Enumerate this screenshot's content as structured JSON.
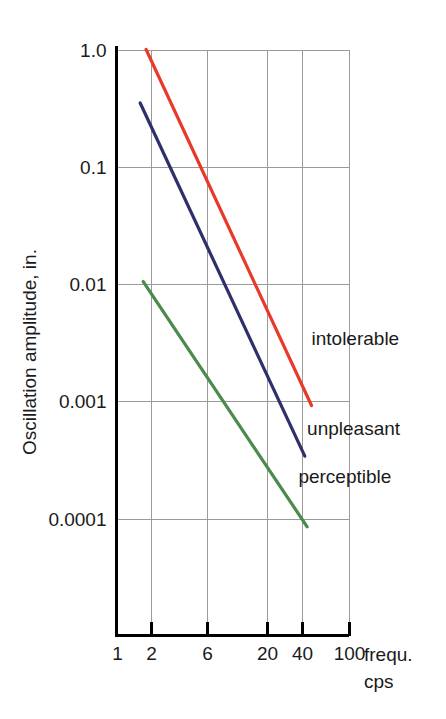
{
  "chart_data": {
    "type": "line",
    "title": "",
    "xlabel": "frequ. cps",
    "xlabel_line1": "frequ.",
    "xlabel_line2": "cps",
    "ylabel": "Oscillation amplitude, in.",
    "xscale": "log",
    "yscale": "log",
    "xlim": [
      1,
      100
    ],
    "ylim": [
      0.0001,
      1.0
    ],
    "grid": true,
    "legend_position": "inline-right-of-curves",
    "xticks": [
      {
        "value": 1,
        "label": "1"
      },
      {
        "value": 2,
        "label": "2"
      },
      {
        "value": 6,
        "label": "6"
      },
      {
        "value": 20,
        "label": "20"
      },
      {
        "value": 40,
        "label": "40"
      },
      {
        "value": 100,
        "label": "100"
      }
    ],
    "yticks": [
      {
        "value": 1.0,
        "label": "1.0"
      },
      {
        "value": 0.1,
        "label": "0.1"
      },
      {
        "value": 0.01,
        "label": "0.01"
      },
      {
        "value": 0.001,
        "label": "0.001"
      },
      {
        "value": 0.0001,
        "label": "0.0001"
      }
    ],
    "series": [
      {
        "name": "intolerable",
        "color": "#e8392a",
        "label": "intolerable",
        "label_at": {
          "x": 48,
          "y": 0.003
        },
        "x": [
          1.8,
          48
        ],
        "y": [
          1.0,
          0.00092
        ],
        "points": [
          {
            "x": 1.8,
            "y": 1.0
          },
          {
            "x": 48,
            "y": 0.00092
          }
        ]
      },
      {
        "name": "unpleasant",
        "color": "#2e2f6b",
        "label": "unpleasant",
        "label_at": {
          "x": 44,
          "y": 0.00052
        },
        "x": [
          1.6,
          42
        ],
        "y": [
          0.35,
          0.00034
        ],
        "points": [
          {
            "x": 1.6,
            "y": 0.35
          },
          {
            "x": 42,
            "y": 0.00034
          }
        ]
      },
      {
        "name": "perceptible",
        "color": "#4a8a4a",
        "label": "perceptible",
        "label_at": {
          "x": 37,
          "y": 0.0002
        },
        "x": [
          1.7,
          44
        ],
        "y": [
          0.0105,
          8.5e-05
        ],
        "points": [
          {
            "x": 1.7,
            "y": 0.0105
          },
          {
            "x": 44,
            "y": 8.5e-05
          }
        ]
      }
    ]
  },
  "axis": {
    "y_title": "Oscillation amplitude, in.",
    "x_title_line1": "frequ.",
    "x_title_line2": "cps"
  },
  "colors": {
    "intolerable": "#e8392a",
    "unpleasant": "#2e2f6b",
    "perceptible": "#4a8a4a",
    "grid": "#9a9a9a",
    "axis": "#000000",
    "text": "#1a1a1a",
    "background": "#ffffff"
  }
}
